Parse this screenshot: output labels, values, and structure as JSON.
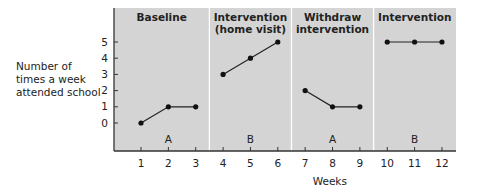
{
  "chart_data": {
    "type": "line",
    "title": "",
    "xlabel": "Weeks",
    "ylabel": "Number of times a week attended school",
    "ylabel_lines": [
      "Number of",
      "times a week",
      "attended school"
    ],
    "x_ticks": [
      1,
      2,
      3,
      4,
      5,
      6,
      7,
      8,
      9,
      10,
      11,
      12
    ],
    "y_ticks": [
      0,
      1,
      2,
      3,
      4,
      5
    ],
    "ylim": [
      -1.7,
      7
    ],
    "xlim": [
      0,
      12.5
    ],
    "grid": false,
    "phases": [
      {
        "label_lines": [
          "Baseline"
        ],
        "letter": "A",
        "weeks": [
          1,
          2,
          3
        ],
        "values": [
          0,
          1,
          1
        ]
      },
      {
        "label_lines": [
          "Intervention",
          "(home visit)"
        ],
        "letter": "B",
        "weeks": [
          4,
          5,
          6
        ],
        "values": [
          3,
          4,
          5
        ]
      },
      {
        "label_lines": [
          "Withdraw",
          "intervention"
        ],
        "letter": "A",
        "weeks": [
          7,
          8,
          9
        ],
        "values": [
          2,
          1,
          1
        ]
      },
      {
        "label_lines": [
          "Intervention"
        ],
        "letter": "B",
        "weeks": [
          10,
          11,
          12
        ],
        "values": [
          5,
          5,
          5
        ]
      }
    ],
    "colors": {
      "panel": "#d4d4d4",
      "divider": "#ffffff",
      "line": "#222222",
      "marker": "#111111"
    }
  }
}
